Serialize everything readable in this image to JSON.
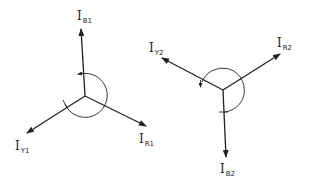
{
  "diagram": {
    "type": "phasor-diagram",
    "colors": {
      "stroke": "#222222",
      "background": "#ffffff"
    },
    "left": {
      "title": "positive sequence",
      "phasors": [
        {
          "main": "I",
          "sub": "B1"
        },
        {
          "main": "I",
          "sub": "Y1"
        },
        {
          "main": "I",
          "sub": "R1"
        }
      ],
      "rotation": "counter-clockwise"
    },
    "right": {
      "title": "negative sequence",
      "phasors": [
        {
          "main": "I",
          "sub": "R2"
        },
        {
          "main": "I",
          "sub": "Y2"
        },
        {
          "main": "I",
          "sub": "B2"
        }
      ],
      "rotation": "counter-clockwise"
    }
  }
}
